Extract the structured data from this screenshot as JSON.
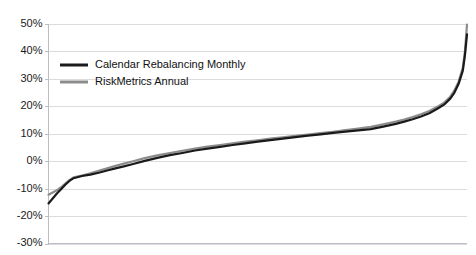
{
  "chart_data": {
    "type": "line",
    "title": "",
    "xlabel": "",
    "ylabel": "",
    "grid": true,
    "legend_position": "top-left",
    "ylim": [
      -30,
      50
    ],
    "xlim": [
      0,
      100
    ],
    "ytick_labels": [
      "50%",
      "40%",
      "30%",
      "20%",
      "10%",
      "0%",
      "-10%",
      "-20%",
      "-30%"
    ],
    "ytick_values": [
      50,
      40,
      30,
      20,
      10,
      0,
      -10,
      -20,
      -30
    ],
    "xtick_labels": [],
    "x": [
      0,
      1,
      2,
      3,
      4,
      5,
      6,
      8,
      10,
      12,
      14,
      16,
      18,
      20,
      23,
      26,
      29,
      32,
      35,
      38,
      41,
      44,
      47,
      50,
      53,
      56,
      59,
      62,
      65,
      68,
      71,
      74,
      77,
      80,
      83,
      85,
      87,
      89,
      91,
      93,
      94.5,
      96,
      97,
      98,
      99,
      99.5,
      100
    ],
    "series": [
      {
        "name": "Calendar Rebalancing Monthly",
        "color": "#1a1a1a",
        "values": [
          -15.4,
          -13.6,
          -11.8,
          -10.2,
          -8.6,
          -7.2,
          -6.2,
          -5.4,
          -4.9,
          -4.2,
          -3.4,
          -2.6,
          -1.9,
          -1.1,
          0.1,
          1.2,
          2.2,
          3.0,
          3.9,
          4.6,
          5.2,
          5.9,
          6.5,
          7.1,
          7.7,
          8.2,
          8.8,
          9.3,
          9.8,
          10.3,
          10.8,
          11.2,
          11.7,
          12.6,
          13.6,
          14.4,
          15.3,
          16.3,
          17.5,
          19.2,
          20.6,
          22.8,
          25.0,
          28.2,
          33.0,
          38.5,
          46.2
        ]
      },
      {
        "name": "RiskMetrics Annual",
        "color": "#8c8c8c",
        "values": [
          -12.2,
          -11.4,
          -10.6,
          -9.5,
          -8.2,
          -6.9,
          -5.9,
          -5.2,
          -4.4,
          -3.5,
          -2.6,
          -1.7,
          -0.9,
          -0.1,
          1.1,
          2.1,
          3.0,
          3.8,
          4.6,
          5.3,
          5.9,
          6.5,
          7.1,
          7.6,
          8.2,
          8.7,
          9.2,
          9.7,
          10.2,
          10.7,
          11.3,
          11.9,
          12.5,
          13.4,
          14.4,
          15.2,
          16.1,
          17.1,
          18.3,
          19.9,
          21.3,
          23.5,
          25.8,
          29.0,
          34.0,
          40.0,
          49.8
        ]
      }
    ]
  },
  "legend": {
    "items": [
      {
        "label": "Calendar Rebalancing Monthly",
        "color": "#1a1a1a"
      },
      {
        "label": "RiskMetrics Annual",
        "color": "#8c8c8c"
      }
    ]
  },
  "colors": {
    "grid": "#dcdce0",
    "axis": "#bdbdc2",
    "plot_background": "#ffffff",
    "series_black": "#1a1a1a",
    "series_gray": "#8c8c8c"
  }
}
